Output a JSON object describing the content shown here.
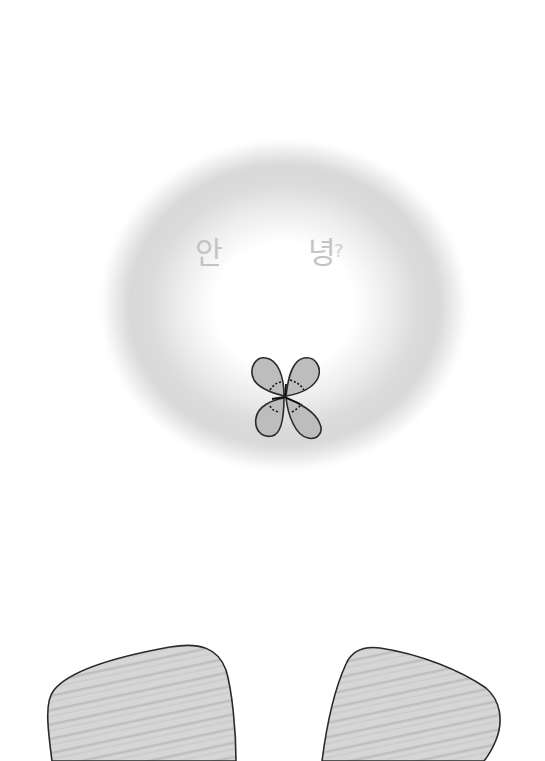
{
  "illustration": {
    "description": "Pencil drawing of a glowing oval halo with a four-leaf clover, greeting text, and two feet at the bottom",
    "greeting": {
      "syllable_1": "안",
      "syllable_2": "녕",
      "punctuation": "?"
    },
    "colors": {
      "background": "#ffffff",
      "halo_shade": "#d8d8d8",
      "text": "#c4c4c4",
      "clover_fill": "#bdbdbd",
      "outline": "#2a2a2a",
      "feet_fill": "#d4d4d4"
    }
  }
}
